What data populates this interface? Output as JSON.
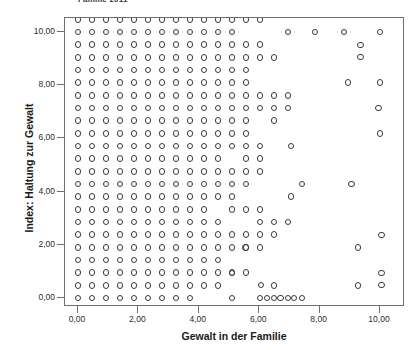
{
  "chart_data": {
    "type": "scatter",
    "title": "Familie 2011",
    "xlabel": "Gewalt in der Familie",
    "ylabel": "Index: Haltung zur Gewalt",
    "xlim": [
      -0.35,
      11.0
    ],
    "ylim": [
      -0.55,
      10.6
    ],
    "xticks": [
      0,
      2,
      4,
      6,
      8,
      10
    ],
    "xticklabels": [
      "0,00",
      "2,00",
      "4,00",
      "6,00",
      "8,00",
      "10,00"
    ],
    "yticks": [
      0,
      2,
      4,
      6,
      8,
      10
    ],
    "yticklabels": [
      "0,00",
      "2,00",
      "4,00",
      "6,00",
      "8,00",
      "10,00"
    ],
    "grid": false,
    "legend": false,
    "marker": "open-circle",
    "marker_color": "#3b3b3b",
    "x_step": 0.4632,
    "y_step": 0.4762,
    "n_points": 377,
    "grid_points": [
      [
        0,
        0
      ],
      [
        1,
        0
      ],
      [
        2,
        0
      ],
      [
        3,
        0
      ],
      [
        4,
        0
      ],
      [
        5,
        0
      ],
      [
        6,
        0
      ],
      [
        7,
        0
      ],
      [
        8,
        0
      ],
      [
        11,
        0
      ],
      [
        13,
        0
      ],
      [
        14,
        0
      ],
      [
        15,
        0
      ],
      [
        16,
        0
      ],
      [
        0,
        1
      ],
      [
        1,
        1
      ],
      [
        2,
        1
      ],
      [
        3,
        1
      ],
      [
        4,
        1
      ],
      [
        5,
        1
      ],
      [
        6,
        1
      ],
      [
        7,
        1
      ],
      [
        8,
        1
      ],
      [
        9,
        1
      ],
      [
        10,
        1
      ],
      [
        14,
        1
      ],
      [
        20,
        1
      ],
      [
        0,
        2
      ],
      [
        1,
        2
      ],
      [
        2,
        2
      ],
      [
        3,
        2
      ],
      [
        4,
        2
      ],
      [
        5,
        2
      ],
      [
        6,
        2
      ],
      [
        7,
        2
      ],
      [
        8,
        2
      ],
      [
        9,
        2
      ],
      [
        10,
        2
      ],
      [
        11,
        2
      ],
      [
        12,
        2
      ],
      [
        0,
        3
      ],
      [
        1,
        3
      ],
      [
        2,
        3
      ],
      [
        3,
        3
      ],
      [
        4,
        3
      ],
      [
        5,
        3
      ],
      [
        6,
        3
      ],
      [
        7,
        3
      ],
      [
        8,
        3
      ],
      [
        9,
        3
      ],
      [
        10,
        3
      ],
      [
        0,
        4
      ],
      [
        1,
        4
      ],
      [
        2,
        4
      ],
      [
        3,
        4
      ],
      [
        4,
        4
      ],
      [
        5,
        4
      ],
      [
        6,
        4
      ],
      [
        7,
        4
      ],
      [
        8,
        4
      ],
      [
        9,
        4
      ],
      [
        10,
        4
      ],
      [
        11,
        4
      ],
      [
        12,
        4
      ],
      [
        13,
        4
      ],
      [
        20,
        4
      ],
      [
        0,
        5
      ],
      [
        1,
        5
      ],
      [
        2,
        5
      ],
      [
        3,
        5
      ],
      [
        4,
        5
      ],
      [
        5,
        5
      ],
      [
        6,
        5
      ],
      [
        7,
        5
      ],
      [
        8,
        5
      ],
      [
        9,
        5
      ],
      [
        10,
        5
      ],
      [
        11,
        5
      ],
      [
        12,
        5
      ],
      [
        13,
        5
      ],
      [
        14,
        5
      ],
      [
        0,
        6
      ],
      [
        1,
        6
      ],
      [
        2,
        6
      ],
      [
        3,
        6
      ],
      [
        4,
        6
      ],
      [
        5,
        6
      ],
      [
        6,
        6
      ],
      [
        7,
        6
      ],
      [
        8,
        6
      ],
      [
        9,
        6
      ],
      [
        10,
        6
      ],
      [
        13,
        6
      ],
      [
        14,
        6
      ],
      [
        15,
        6
      ],
      [
        0,
        7
      ],
      [
        1,
        7
      ],
      [
        2,
        7
      ],
      [
        3,
        7
      ],
      [
        4,
        7
      ],
      [
        5,
        7
      ],
      [
        6,
        7
      ],
      [
        7,
        7
      ],
      [
        8,
        7
      ],
      [
        9,
        7
      ],
      [
        11,
        7
      ],
      [
        12,
        7
      ],
      [
        13,
        7
      ],
      [
        0,
        8
      ],
      [
        1,
        8
      ],
      [
        2,
        8
      ],
      [
        3,
        8
      ],
      [
        4,
        8
      ],
      [
        5,
        8
      ],
      [
        6,
        8
      ],
      [
        7,
        8
      ],
      [
        8,
        8
      ],
      [
        9,
        8
      ],
      [
        10,
        8
      ],
      [
        11,
        8
      ],
      [
        0,
        9
      ],
      [
        1,
        9
      ],
      [
        2,
        9
      ],
      [
        3,
        9
      ],
      [
        4,
        9
      ],
      [
        5,
        9
      ],
      [
        6,
        9
      ],
      [
        7,
        9
      ],
      [
        8,
        9
      ],
      [
        9,
        9
      ],
      [
        10,
        9
      ],
      [
        11,
        9
      ],
      [
        12,
        9
      ],
      [
        16,
        9
      ],
      [
        0,
        10
      ],
      [
        1,
        10
      ],
      [
        2,
        10
      ],
      [
        3,
        10
      ],
      [
        4,
        10
      ],
      [
        5,
        10
      ],
      [
        6,
        10
      ],
      [
        7,
        10
      ],
      [
        8,
        10
      ],
      [
        9,
        10
      ],
      [
        10,
        10
      ],
      [
        11,
        10
      ],
      [
        12,
        10
      ],
      [
        13,
        10
      ],
      [
        0,
        11
      ],
      [
        1,
        11
      ],
      [
        2,
        11
      ],
      [
        3,
        11
      ],
      [
        4,
        11
      ],
      [
        5,
        11
      ],
      [
        6,
        11
      ],
      [
        7,
        11
      ],
      [
        8,
        11
      ],
      [
        9,
        11
      ],
      [
        10,
        11
      ],
      [
        12,
        11
      ],
      [
        13,
        11
      ],
      [
        0,
        12
      ],
      [
        1,
        12
      ],
      [
        2,
        12
      ],
      [
        3,
        12
      ],
      [
        4,
        12
      ],
      [
        5,
        12
      ],
      [
        6,
        12
      ],
      [
        7,
        12
      ],
      [
        8,
        12
      ],
      [
        9,
        12
      ],
      [
        10,
        12
      ],
      [
        11,
        12
      ],
      [
        12,
        12
      ],
      [
        13,
        12
      ],
      [
        0,
        13
      ],
      [
        1,
        13
      ],
      [
        2,
        13
      ],
      [
        3,
        13
      ],
      [
        4,
        13
      ],
      [
        5,
        13
      ],
      [
        6,
        13
      ],
      [
        7,
        13
      ],
      [
        8,
        13
      ],
      [
        9,
        13
      ],
      [
        10,
        13
      ],
      [
        11,
        13
      ],
      [
        12,
        13
      ],
      [
        0,
        14
      ],
      [
        1,
        14
      ],
      [
        2,
        14
      ],
      [
        3,
        14
      ],
      [
        4,
        14
      ],
      [
        5,
        14
      ],
      [
        6,
        14
      ],
      [
        7,
        14
      ],
      [
        8,
        14
      ],
      [
        9,
        14
      ],
      [
        10,
        14
      ],
      [
        11,
        14
      ],
      [
        12,
        14
      ],
      [
        14,
        14
      ],
      [
        0,
        15
      ],
      [
        1,
        15
      ],
      [
        2,
        15
      ],
      [
        3,
        15
      ],
      [
        4,
        15
      ],
      [
        5,
        15
      ],
      [
        6,
        15
      ],
      [
        7,
        15
      ],
      [
        8,
        15
      ],
      [
        9,
        15
      ],
      [
        10,
        15
      ],
      [
        11,
        15
      ],
      [
        12,
        15
      ],
      [
        13,
        15
      ],
      [
        14,
        15
      ],
      [
        15,
        15
      ],
      [
        0,
        16
      ],
      [
        1,
        16
      ],
      [
        2,
        16
      ],
      [
        3,
        16
      ],
      [
        4,
        16
      ],
      [
        5,
        16
      ],
      [
        6,
        16
      ],
      [
        7,
        16
      ],
      [
        8,
        16
      ],
      [
        9,
        16
      ],
      [
        10,
        16
      ],
      [
        11,
        16
      ],
      [
        12,
        16
      ],
      [
        13,
        16
      ],
      [
        14,
        16
      ],
      [
        15,
        16
      ],
      [
        0,
        17
      ],
      [
        1,
        17
      ],
      [
        2,
        17
      ],
      [
        3,
        17
      ],
      [
        4,
        17
      ],
      [
        5,
        17
      ],
      [
        6,
        17
      ],
      [
        7,
        17
      ],
      [
        8,
        17
      ],
      [
        9,
        17
      ],
      [
        10,
        17
      ],
      [
        11,
        17
      ],
      [
        12,
        17
      ],
      [
        0,
        18
      ],
      [
        1,
        18
      ],
      [
        2,
        18
      ],
      [
        3,
        18
      ],
      [
        4,
        18
      ],
      [
        5,
        18
      ],
      [
        6,
        18
      ],
      [
        7,
        18
      ],
      [
        8,
        18
      ],
      [
        9,
        18
      ],
      [
        10,
        18
      ],
      [
        11,
        18
      ],
      [
        12,
        18
      ],
      [
        0,
        19
      ],
      [
        1,
        19
      ],
      [
        2,
        19
      ],
      [
        3,
        19
      ],
      [
        4,
        19
      ],
      [
        5,
        19
      ],
      [
        6,
        19
      ],
      [
        7,
        19
      ],
      [
        8,
        19
      ],
      [
        9,
        19
      ],
      [
        10,
        19
      ],
      [
        11,
        19
      ],
      [
        12,
        19
      ],
      [
        13,
        19
      ],
      [
        14,
        19
      ],
      [
        0,
        20
      ],
      [
        1,
        20
      ],
      [
        2,
        20
      ],
      [
        3,
        20
      ],
      [
        4,
        20
      ],
      [
        5,
        20
      ],
      [
        6,
        20
      ],
      [
        7,
        20
      ],
      [
        8,
        20
      ],
      [
        9,
        20
      ],
      [
        10,
        20
      ],
      [
        11,
        20
      ],
      [
        12,
        20
      ],
      [
        13,
        20
      ],
      [
        0,
        21
      ],
      [
        1,
        21
      ],
      [
        2,
        21
      ],
      [
        3,
        21
      ],
      [
        4,
        21
      ],
      [
        5,
        21
      ],
      [
        6,
        21
      ],
      [
        7,
        21
      ],
      [
        8,
        21
      ],
      [
        9,
        21
      ],
      [
        10,
        21
      ],
      [
        11,
        21
      ],
      [
        0,
        22
      ],
      [
        1,
        22
      ],
      [
        2,
        22
      ],
      [
        3,
        22
      ],
      [
        4,
        22
      ],
      [
        5,
        22
      ],
      [
        6,
        22
      ],
      [
        7,
        22
      ],
      [
        8,
        22
      ],
      [
        9,
        22
      ],
      [
        10,
        22
      ],
      [
        11,
        22
      ],
      [
        12,
        22
      ],
      [
        13,
        22
      ],
      [
        0,
        23
      ],
      [
        1,
        23
      ],
      [
        2,
        23
      ],
      [
        3,
        23
      ],
      [
        4,
        23
      ],
      [
        5,
        23
      ],
      [
        6,
        23
      ],
      [
        7,
        23
      ],
      [
        8,
        23
      ],
      [
        9,
        23
      ],
      [
        10,
        23
      ],
      [
        11,
        23
      ],
      [
        12,
        23
      ],
      [
        13,
        23
      ],
      [
        14,
        23
      ],
      [
        0,
        24
      ],
      [
        1,
        24
      ],
      [
        2,
        24
      ],
      [
        3,
        24
      ],
      [
        4,
        24
      ],
      [
        5,
        24
      ],
      [
        6,
        24
      ],
      [
        7,
        24
      ],
      [
        8,
        24
      ],
      [
        9,
        24
      ],
      [
        10,
        24
      ],
      [
        11,
        24
      ],
      [
        12,
        24
      ],
      [
        13,
        24
      ],
      [
        14,
        24
      ],
      [
        21,
        24
      ],
      [
        0,
        25
      ],
      [
        1,
        25
      ],
      [
        2,
        25
      ],
      [
        3,
        25
      ],
      [
        4,
        25
      ],
      [
        5,
        25
      ],
      [
        6,
        25
      ],
      [
        7,
        25
      ],
      [
        8,
        25
      ],
      [
        9,
        25
      ],
      [
        10,
        25
      ],
      [
        11,
        25
      ],
      [
        12,
        25
      ],
      [
        13,
        25
      ],
      [
        14,
        25
      ],
      [
        15,
        25
      ],
      [
        16,
        25
      ]
    ],
    "extra_points": [
      [
        6.95,
        10.0
      ],
      [
        7.85,
        10.0
      ],
      [
        8.8,
        10.0
      ],
      [
        10.0,
        10.0
      ],
      [
        9.35,
        9.52
      ],
      [
        9.35,
        9.05
      ],
      [
        10.0,
        8.1
      ],
      [
        8.95,
        8.1
      ],
      [
        9.95,
        7.14
      ],
      [
        10.0,
        6.19
      ],
      [
        7.05,
        5.71
      ],
      [
        9.05,
        4.29
      ],
      [
        7.05,
        3.81
      ],
      [
        10.05,
        2.38
      ],
      [
        10.05,
        0.95
      ],
      [
        10.05,
        0.48
      ],
      [
        5.55,
        1.9
      ],
      [
        6.25,
        0.0
      ],
      [
        6.7,
        0.0
      ],
      [
        7.15,
        0.0
      ],
      [
        6.05,
        0.48
      ],
      [
        5.1,
        0.95
      ]
    ]
  }
}
